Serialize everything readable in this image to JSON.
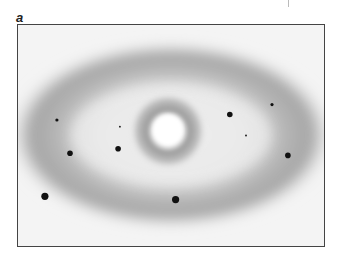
{
  "figure": {
    "panel_label": "a",
    "colors": {
      "background": "#f4f4f4",
      "halo": "#8e8e8e",
      "spot": "#111111",
      "frame": "#444444"
    },
    "spots": [
      {
        "id": "spot-1",
        "x_frac": 0.127,
        "y_frac": 0.43,
        "size": "small"
      },
      {
        "id": "spot-2",
        "x_frac": 0.333,
        "y_frac": 0.46,
        "size": "tiny"
      },
      {
        "id": "spot-3",
        "x_frac": 0.17,
        "y_frac": 0.58,
        "size": "medium"
      },
      {
        "id": "spot-4",
        "x_frac": 0.327,
        "y_frac": 0.56,
        "size": "medium"
      },
      {
        "id": "spot-5",
        "x_frac": 0.088,
        "y_frac": 0.775,
        "size": "large"
      },
      {
        "id": "spot-6",
        "x_frac": 0.515,
        "y_frac": 0.79,
        "size": "large"
      },
      {
        "id": "spot-7",
        "x_frac": 0.692,
        "y_frac": 0.405,
        "size": "medium"
      },
      {
        "id": "spot-8",
        "x_frac": 0.83,
        "y_frac": 0.36,
        "size": "small"
      },
      {
        "id": "spot-9",
        "x_frac": 0.745,
        "y_frac": 0.5,
        "size": "tiny"
      },
      {
        "id": "spot-10",
        "x_frac": 0.882,
        "y_frac": 0.59,
        "size": "medium"
      }
    ]
  }
}
